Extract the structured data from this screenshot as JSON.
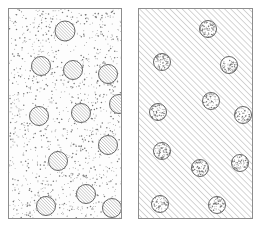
{
  "figure": {
    "type": "technical-illustration",
    "canvas": {
      "width": 263,
      "height": 231
    },
    "background_color": "#ffffff",
    "line_color": "#555555",
    "border_color": "#8d8d8d",
    "stipple_color": "#777777",
    "hatch_color": "#666666"
  },
  "panels": [
    {
      "id": "panel-left",
      "label": "",
      "x": 8,
      "y": 8,
      "width": 114,
      "height": 211,
      "matrix_fill": "stipple",
      "inclusion_fill": "hatch",
      "hatch_angle_deg": 45,
      "hatch_spacing_px": 2.2,
      "stipple_density": 0.055,
      "circle_radius_px": 9.5,
      "circle_count": 13,
      "circles": [
        {
          "cx": 57,
          "cy": 23,
          "r": 10.0
        },
        {
          "cx": 33,
          "cy": 58,
          "r": 9.5
        },
        {
          "cx": 65,
          "cy": 62,
          "r": 9.5
        },
        {
          "cx": 100,
          "cy": 66,
          "r": 9.5
        },
        {
          "cx": 111,
          "cy": 96,
          "r": 9.5
        },
        {
          "cx": 31,
          "cy": 108,
          "r": 9.5
        },
        {
          "cx": 73,
          "cy": 105,
          "r": 9.5
        },
        {
          "cx": 100,
          "cy": 137,
          "r": 9.5
        },
        {
          "cx": 50,
          "cy": 153,
          "r": 9.5
        },
        {
          "cx": 78,
          "cy": 186,
          "r": 9.5
        },
        {
          "cx": 38,
          "cy": 198,
          "r": 9.5
        },
        {
          "cx": 104,
          "cy": 200,
          "r": 9.5
        }
      ]
    },
    {
      "id": "panel-right",
      "label": "",
      "x": 138,
      "y": 8,
      "width": 115,
      "height": 211,
      "matrix_fill": "hatch",
      "inclusion_fill": "stipple",
      "hatch_angle_deg": 45,
      "hatch_spacing_px": 4.3,
      "stipple_density": 0.08,
      "circle_radius_px": 8.5,
      "circle_count": 12,
      "circles": [
        {
          "cx": 70,
          "cy": 21,
          "r": 8.5
        },
        {
          "cx": 24,
          "cy": 54,
          "r": 8.5
        },
        {
          "cx": 91,
          "cy": 57,
          "r": 8.5
        },
        {
          "cx": 73,
          "cy": 93,
          "r": 8.5
        },
        {
          "cx": 20,
          "cy": 104,
          "r": 8.5
        },
        {
          "cx": 105,
          "cy": 107,
          "r": 8.5
        },
        {
          "cx": 24,
          "cy": 143,
          "r": 8.5
        },
        {
          "cx": 102,
          "cy": 155,
          "r": 8.5
        },
        {
          "cx": 62,
          "cy": 160,
          "r": 8.5
        },
        {
          "cx": 22,
          "cy": 196,
          "r": 8.5
        },
        {
          "cx": 79,
          "cy": 197,
          "r": 8.5
        }
      ]
    }
  ],
  "captions": {
    "left_caption": "",
    "right_caption": ""
  }
}
